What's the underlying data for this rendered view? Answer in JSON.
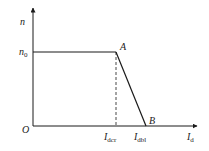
{
  "diagram": {
    "type": "speed-current characteristic",
    "colors": {
      "line": "#1a1a1a",
      "background": "#ffffff"
    },
    "axes": {
      "y_label": {
        "main": "n",
        "sub": ""
      },
      "x_label": {
        "main": "I",
        "sub": "d"
      },
      "origin": "O"
    },
    "levels": {
      "n0": {
        "main": "n",
        "sub": "0"
      }
    },
    "points": {
      "A": "A",
      "B": "B"
    },
    "x_ticks": {
      "dcr": {
        "main": "I",
        "sub": "dcr"
      },
      "dbl": {
        "main": "I",
        "sub": "dbl"
      }
    }
  }
}
